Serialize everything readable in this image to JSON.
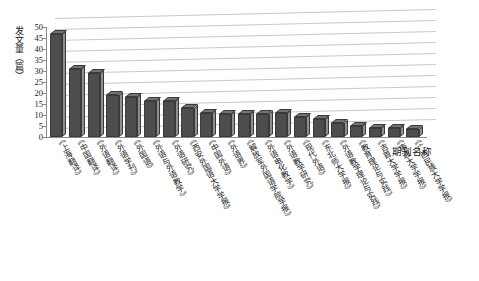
{
  "chart_data": {
    "type": "bar",
    "title": "",
    "xlabel": "期刊名称",
    "ylabel": "发文量（篇）",
    "ylim": [
      0,
      50
    ],
    "ytick_step": 5,
    "yticks": [
      50,
      45,
      40,
      35,
      30,
      25,
      20,
      15,
      10,
      5,
      0
    ],
    "grid": true,
    "legend": "none",
    "style": "3d-column",
    "bar_color": "#4d4d4d",
    "bar_side_color": "#8f8f8f",
    "bar_top_color": "#737373",
    "gridline_color": "#c9c9c9",
    "axis_color": "#8a8a8a",
    "categories": [
      "《上海翻译》",
      "《中国翻译》",
      "《外语翻译》",
      "《外语学刊》",
      "《外国语》",
      "《外语与外语教学》",
      "《外语研究》",
      "《西安外国语大学学报》",
      "《中国外语》",
      "《外语界》",
      "《解放军外国语学院学报》",
      "《外语电化教学》",
      "《外语教学研究》",
      "《现代外语》",
      "《东北师大学报》",
      "《外语教学理论与实践》",
      "《教育理论与实践》",
      "《吉首大学学报》",
      "《南通大学学报》",
      "《广西民族大学学报》"
    ],
    "values": [
      47,
      31,
      29,
      19,
      18,
      16.5,
      16.5,
      13,
      11,
      10.5,
      10.5,
      10.5,
      11,
      9,
      8,
      6.5,
      5,
      4,
      4,
      3.5
    ]
  }
}
